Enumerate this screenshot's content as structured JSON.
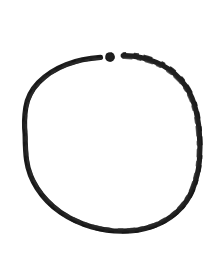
{
  "canvas": {
    "width": 213,
    "height": 255,
    "background_color": "#ffffff",
    "alt_text": "Hand-drawn open ring with a separate dot in the top gap"
  },
  "figure": {
    "name": "open-ring-with-dot",
    "stroke_color": "#1f1f1f",
    "ink_color": "#262626",
    "stroke_width": 5.2,
    "style": "hand-drawn rough ink stroke"
  },
  "ring": {
    "label": "open ring arc",
    "center_x": 112,
    "center_y": 144.5,
    "radius_x": 87,
    "radius_y": 89,
    "gap_start_angle_deg": 258,
    "gap_end_angle_deg": 282,
    "bounds": {
      "left": 25,
      "top": 55,
      "right": 200,
      "bottom": 234
    }
  },
  "dot": {
    "label": "gap dot",
    "center_x": 110,
    "center_y": 57,
    "radius": 4.8,
    "color": "#1f1f1f"
  },
  "arc_left": {
    "label": "left arc terminus",
    "end_x": 100,
    "end_y": 57
  },
  "arc_right": {
    "label": "right arc terminus",
    "start_x": 123,
    "start_y": 56
  }
}
